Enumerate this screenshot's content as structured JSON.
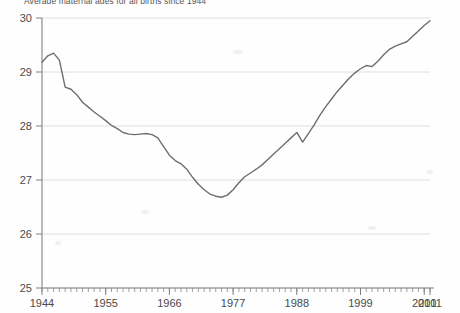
{
  "chart_data": {
    "type": "line",
    "title": "Average maternal ages for all births since 1944",
    "xlabel": "",
    "ylabel": "",
    "xlim": [
      1944,
      2011
    ],
    "ylim": [
      25,
      30
    ],
    "grid": true,
    "legend": "none",
    "line_color": "#6e6e6e",
    "background_color": "#fefefe",
    "grid_color": "#d8d8d8",
    "axis_color": "#808080",
    "y_ticks": [
      25,
      26,
      27,
      28,
      29,
      30
    ],
    "y_tick_labels": [
      "25",
      "26",
      "27",
      "28",
      "29",
      "30"
    ],
    "x_ticks": [
      1944,
      1955,
      1966,
      1977,
      1988,
      1999,
      2010,
      2011
    ],
    "x_tick_labels": [
      "1944",
      "1955",
      "1966",
      "1977",
      "1988",
      "1999",
      "2010",
      "2011"
    ],
    "x_minor_tick_step": 1,
    "series": [
      {
        "name": "Average maternal age",
        "x": [
          1944,
          1945,
          1946,
          1947,
          1948,
          1949,
          1950,
          1951,
          1952,
          1953,
          1954,
          1955,
          1956,
          1957,
          1958,
          1959,
          1960,
          1961,
          1962,
          1963,
          1964,
          1965,
          1966,
          1967,
          1968,
          1969,
          1970,
          1971,
          1972,
          1973,
          1974,
          1975,
          1976,
          1977,
          1978,
          1979,
          1980,
          1981,
          1982,
          1983,
          1984,
          1985,
          1986,
          1987,
          1988,
          1989,
          1990,
          1991,
          1992,
          1993,
          1994,
          1995,
          1996,
          1997,
          1998,
          1999,
          2000,
          2001,
          2002,
          2003,
          2004,
          2005,
          2006,
          2007,
          2008,
          2009,
          2010,
          2011
        ],
        "values": [
          29.18,
          29.3,
          29.35,
          29.22,
          28.72,
          28.68,
          28.58,
          28.44,
          28.35,
          28.26,
          28.18,
          28.1,
          28.01,
          27.95,
          27.88,
          27.85,
          27.84,
          27.85,
          27.86,
          27.84,
          27.78,
          27.62,
          27.46,
          27.36,
          27.3,
          27.2,
          27.05,
          26.92,
          26.82,
          26.74,
          26.7,
          26.68,
          26.72,
          26.82,
          26.95,
          27.06,
          27.13,
          27.2,
          27.28,
          27.38,
          27.48,
          27.58,
          27.68,
          27.78,
          27.88,
          27.7,
          27.86,
          28.02,
          28.2,
          28.36,
          28.5,
          28.64,
          28.76,
          28.88,
          28.98,
          29.06,
          29.12,
          29.1,
          29.2,
          29.32,
          29.42,
          29.48,
          29.52,
          29.56,
          29.66,
          29.76,
          29.86,
          29.95
        ]
      }
    ]
  },
  "axes": {
    "y_axis_name": "y-axis",
    "x_axis_name": "x-axis"
  }
}
